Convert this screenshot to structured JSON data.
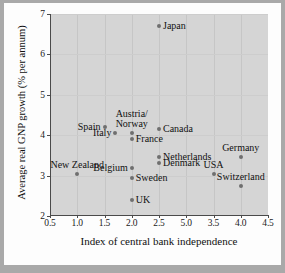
{
  "chart_data": {
    "type": "scatter",
    "title": "",
    "xlabel": "Index of central bank independence",
    "ylabel": "Average real GNP growth (% per annum)",
    "xlim": [
      0.5,
      4.5
    ],
    "ylim": [
      2,
      7
    ],
    "xticks": [
      "0.5",
      "1.0",
      "1.5",
      "2.0",
      "2.5",
      "5.0",
      "3.5",
      "4.0",
      "4.5"
    ],
    "xtick_values": [
      0.5,
      1.0,
      1.5,
      2.0,
      2.5,
      3.0,
      3.5,
      4.0,
      4.5
    ],
    "yticks": [
      "2",
      "3",
      "4",
      "5",
      "6",
      "7"
    ],
    "ytick_values": [
      2,
      3,
      4,
      5,
      6,
      7
    ],
    "grid": true,
    "legend": "none",
    "marker_color": "#6f6f6f",
    "plot_background": "#d5d5d5",
    "points": [
      {
        "label": "Japan",
        "x": 2.5,
        "y": 6.7,
        "label_pos": "r"
      },
      {
        "label": "Spain",
        "x": 1.5,
        "y": 4.2,
        "label_pos": "l"
      },
      {
        "label": "Italy",
        "x": 1.7,
        "y": 4.05,
        "label_pos": "l"
      },
      {
        "label": "Austria/\nNorway",
        "x": 2.0,
        "y": 4.05,
        "label_pos": "c"
      },
      {
        "label": "France",
        "x": 2.0,
        "y": 3.9,
        "label_pos": "r"
      },
      {
        "label": "Canada",
        "x": 2.5,
        "y": 4.15,
        "label_pos": "r"
      },
      {
        "label": "Netherlands",
        "x": 2.5,
        "y": 3.45,
        "label_pos": "r"
      },
      {
        "label": "Denmark",
        "x": 2.5,
        "y": 3.3,
        "label_pos": "r"
      },
      {
        "label": "Germany",
        "x": 4.0,
        "y": 3.45,
        "label_pos": "c"
      },
      {
        "label": "Belgium",
        "x": 2.0,
        "y": 3.2,
        "label_pos": "l"
      },
      {
        "label": "New Zealand",
        "x": 1.0,
        "y": 3.05,
        "label_pos": "c"
      },
      {
        "label": "Sweden",
        "x": 2.0,
        "y": 2.95,
        "label_pos": "r"
      },
      {
        "label": "USA",
        "x": 3.5,
        "y": 3.05,
        "label_pos": "c"
      },
      {
        "label": "Switzerland",
        "x": 4.0,
        "y": 2.75,
        "label_pos": "c"
      },
      {
        "label": "UK",
        "x": 2.0,
        "y": 2.4,
        "label_pos": "r"
      }
    ]
  },
  "figure": {
    "background": "#fdfdfd",
    "page_background": "#a9a9a9"
  }
}
